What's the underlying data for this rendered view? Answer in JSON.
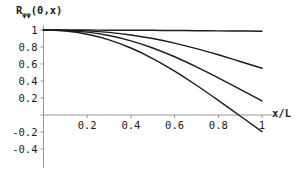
{
  "chart_data": {
    "type": "line",
    "title": "",
    "subtitle": "",
    "ylabel": "Rφφ(0,x)",
    "ylabel_base": "R",
    "ylabel_sub": "φφ",
    "ylabel_arg": "(0,x)",
    "xlabel": "x/L",
    "xlim": [
      0,
      1.05
    ],
    "ylim": [
      -0.62,
      1.05
    ],
    "grid": false,
    "legend": "none",
    "xticks": [
      0.2,
      0.4,
      0.6,
      0.8,
      1
    ],
    "xticklabels": [
      "0.2",
      "0.4",
      "0.6",
      "0.8",
      "1"
    ],
    "yticks": [
      1,
      0.8,
      0.6,
      0.4,
      0.2,
      -0.2,
      -0.4
    ],
    "yticklabels": [
      "1",
      "0.8",
      "0.6",
      "0.4",
      "0.2",
      "-0.2",
      "-0.4"
    ],
    "y_zero_unlabeled": true,
    "x": [
      0,
      0.1,
      0.2,
      0.3,
      0.4,
      0.5,
      0.6,
      0.7,
      0.8,
      0.9,
      1
    ],
    "series": [
      {
        "name": "curve-1",
        "values": [
          1.0,
          1.0,
          0.999,
          0.998,
          0.997,
          0.996,
          0.994,
          0.992,
          0.99,
          0.988,
          0.986
        ],
        "color": "#1c1c1c"
      },
      {
        "name": "curve-2",
        "values": [
          1.0,
          0.998,
          0.99,
          0.972,
          0.942,
          0.9,
          0.846,
          0.781,
          0.708,
          0.63,
          0.55
        ],
        "color": "#1c1c1c"
      },
      {
        "name": "curve-3",
        "values": [
          1.0,
          0.995,
          0.975,
          0.935,
          0.872,
          0.788,
          0.685,
          0.566,
          0.437,
          0.302,
          0.165
        ],
        "color": "#1c1c1c"
      },
      {
        "name": "curve-4",
        "values": [
          1.0,
          0.988,
          0.95,
          0.884,
          0.788,
          0.664,
          0.516,
          0.35,
          0.172,
          -0.012,
          -0.195
        ],
        "color": "#1c1c1c"
      }
    ]
  },
  "style": {
    "axis_color": "#8a8a8a",
    "curve_color": "#1c1c1c",
    "text_color": "#1a1a1a",
    "background": "#ffffff"
  }
}
